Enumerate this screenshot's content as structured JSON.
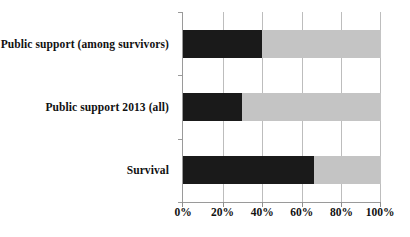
{
  "chart_data": {
    "type": "bar",
    "orientation": "horizontal",
    "stacked": true,
    "title": "",
    "subtitle": "",
    "xlabel": "",
    "ylabel": "",
    "xlim": [
      0,
      100
    ],
    "xticks": [
      "0%",
      "20%",
      "40%",
      "60%",
      "80%",
      "100%"
    ],
    "xtick_values": [
      0,
      20,
      40,
      60,
      80,
      100
    ],
    "grid": true,
    "legend": "none",
    "categories": [
      "Public support (among survivors)",
      "Public support 2013 (all)",
      "Survival"
    ],
    "series": [
      {
        "name": "dark",
        "color": "#1a1a1a",
        "values": [
          40,
          30,
          66
        ]
      },
      {
        "name": "light",
        "color": "#c4c4c4",
        "values": [
          60,
          70,
          34
        ]
      }
    ]
  },
  "colors": {
    "dark": "#1a1a1a",
    "light": "#c4c4c4",
    "grid": "#bdbdbd",
    "axis": "#9a9a9a",
    "text": "#111111",
    "background": "#ffffff"
  }
}
